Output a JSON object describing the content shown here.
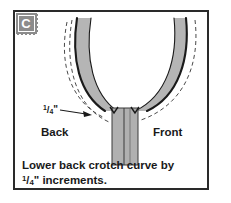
{
  "figure": {
    "step_letter": "C",
    "frame_color": "#2a2a2a",
    "background_color": "#ffffff",
    "badge_color": "#8c8c8c"
  },
  "labels": {
    "back": "Back",
    "front": "Front",
    "measurement": {
      "numerator": "1",
      "slash": "/",
      "denominator": "4",
      "unit": "\""
    }
  },
  "caption": {
    "line1": "Lower back crotch curve by",
    "line2_numerator": "1",
    "line2_slash": "/",
    "line2_denominator": "4",
    "line2_rest": "\" increments."
  },
  "diagram": {
    "curve_color": "#1a1a1a",
    "curve_fill": "#b5b5b5",
    "dashed_color": "#4a4a4a",
    "strip_fill": "#b0b0b0",
    "strip_edge": "#3a3a3a",
    "arrow_label_target": "dashed offset curve"
  }
}
